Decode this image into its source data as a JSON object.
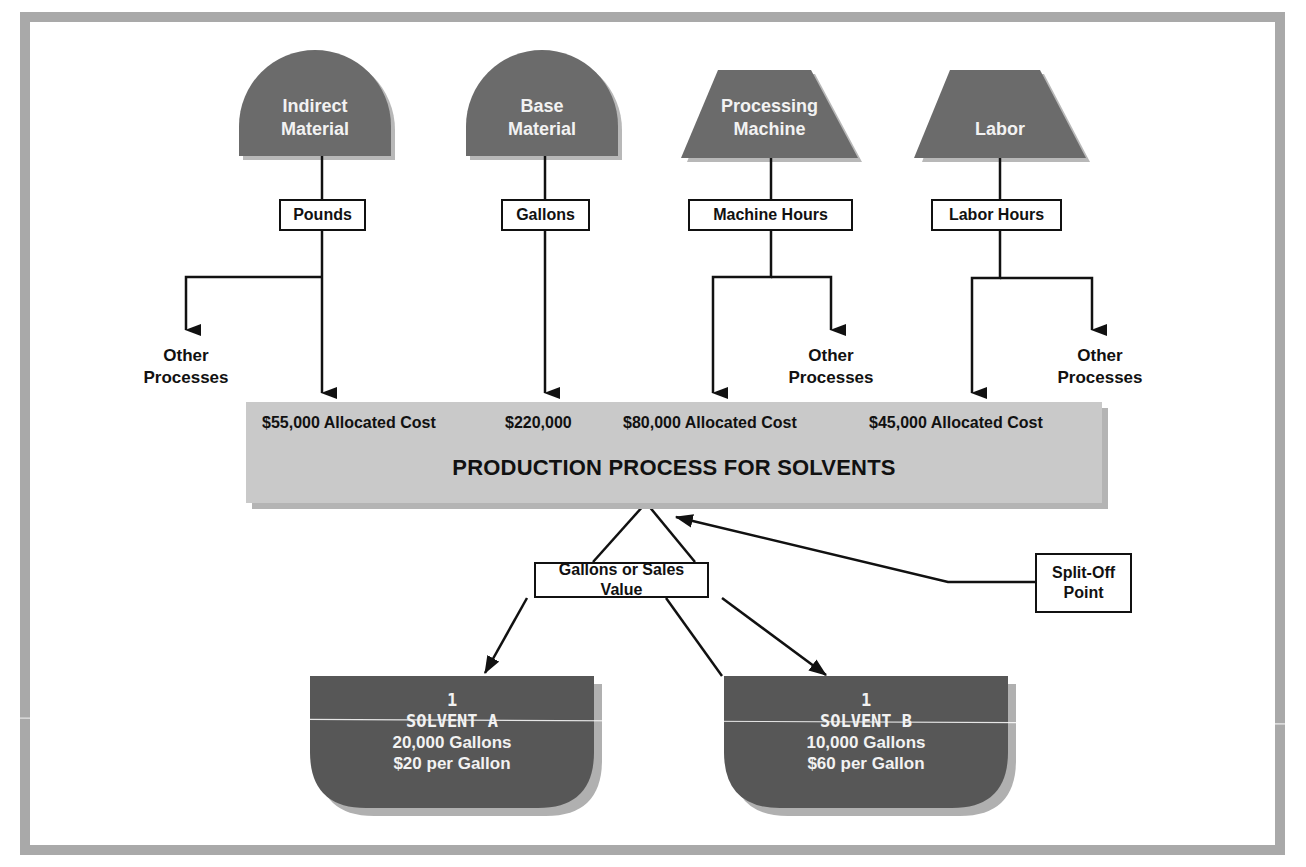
{
  "diagram": {
    "title": "PRODUCTION PROCESS FOR SOLVENTS",
    "colors": {
      "frame": "#a9a9a9",
      "source_shape": "#6b6b6b",
      "process_bar": "#c9c9c9",
      "product_shape": "#575757",
      "line": "#111111"
    },
    "sources": [
      {
        "id": "indirect-material",
        "label_line1": "Indirect",
        "label_line2": "Material",
        "shape": "dome",
        "driver": "Pounds",
        "allocated_cost": "$55,000 Allocated Cost",
        "has_other_processes": true,
        "other_processes_side": "left"
      },
      {
        "id": "base-material",
        "label_line1": "Base",
        "label_line2": "Material",
        "shape": "dome",
        "driver": "Gallons",
        "allocated_cost": "$220,000",
        "has_other_processes": false
      },
      {
        "id": "processing-machine",
        "label_line1": "Processing",
        "label_line2": "Machine",
        "shape": "trapezoid",
        "driver": "Machine Hours",
        "allocated_cost": "$80,000 Allocated Cost",
        "has_other_processes": true,
        "other_processes_side": "right"
      },
      {
        "id": "labor",
        "label_line1": "Labor",
        "label_line2": "",
        "shape": "trapezoid",
        "driver": "Labor Hours",
        "allocated_cost": "$45,000 Allocated Cost",
        "has_other_processes": true,
        "other_processes_side": "right"
      }
    ],
    "other_processes": {
      "line1": "Other",
      "line2": "Processes"
    },
    "split_basis": "Gallons or Sales Value",
    "split_off": {
      "line1": "Split-Off",
      "line2": "Point"
    },
    "products": [
      {
        "id": "solvent-a",
        "number": "1",
        "name": "SOLVENT A",
        "quantity": "20,000 Gallons",
        "price": "$20 per Gallon"
      },
      {
        "id": "solvent-b",
        "number": "1",
        "name": "SOLVENT B",
        "quantity": "10,000 Gallons",
        "price": "$60 per Gallon"
      }
    ]
  }
}
